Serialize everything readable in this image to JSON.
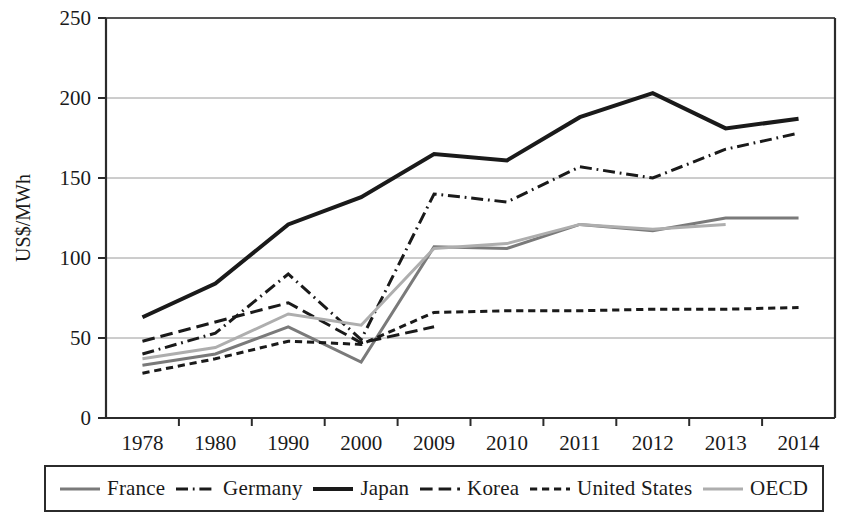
{
  "chart_data": {
    "type": "line",
    "title": "",
    "xlabel": "",
    "ylabel": "US$/MWh",
    "categories": [
      "1978",
      "1980",
      "1990",
      "2000",
      "2009",
      "2010",
      "2011",
      "2012",
      "2013",
      "2014"
    ],
    "ylim": [
      0,
      250
    ],
    "yticks": [
      0,
      50,
      100,
      150,
      200,
      250
    ],
    "grid": "horizontal",
    "legend_position": "bottom",
    "series": [
      {
        "name": "France",
        "color": "#7a7a7a",
        "style": "solid",
        "width": 3,
        "values": [
          33,
          40,
          57,
          35,
          107,
          106,
          121,
          117,
          125,
          125
        ]
      },
      {
        "name": "Germany",
        "color": "#1a1a1a",
        "style": "dashdot",
        "width": 3,
        "values": [
          40,
          53,
          90,
          49,
          140,
          135,
          157,
          150,
          168,
          178
        ]
      },
      {
        "name": "Japan",
        "color": "#1a1a1a",
        "style": "solid",
        "width": 4,
        "values": [
          63,
          84,
          121,
          138,
          165,
          161,
          188,
          203,
          181,
          187
        ]
      },
      {
        "name": "Korea",
        "color": "#1a1a1a",
        "style": "longdash",
        "width": 3,
        "values": [
          48,
          60,
          72,
          47,
          57,
          null,
          null,
          null,
          null,
          null
        ]
      },
      {
        "name": "United States",
        "color": "#1a1a1a",
        "style": "shortdash",
        "width": 3,
        "values": [
          28,
          37,
          48,
          46,
          66,
          67,
          67,
          68,
          68,
          69
        ]
      },
      {
        "name": "OECD",
        "color": "#aeaeae",
        "style": "solid",
        "width": 3,
        "values": [
          37,
          44,
          65,
          58,
          106,
          109,
          121,
          118,
          121,
          null
        ]
      }
    ]
  },
  "axis": {
    "y_title": "US$/MWh",
    "y_tick_labels": [
      "250",
      "200",
      "150",
      "100",
      "50",
      "0"
    ],
    "x_tick_labels": [
      "1978",
      "1980",
      "1990",
      "2000",
      "2009",
      "2010",
      "2011",
      "2012",
      "2013",
      "2014"
    ]
  },
  "legend": {
    "items": [
      {
        "label": "France",
        "style": "solid",
        "color": "#7a7a7a"
      },
      {
        "label": "Germany",
        "style": "dashdot",
        "color": "#1a1a1a"
      },
      {
        "label": "Japan",
        "style": "solid",
        "color": "#1a1a1a"
      },
      {
        "label": "Korea",
        "style": "longdash",
        "color": "#1a1a1a"
      },
      {
        "label": "United States",
        "style": "shortdash",
        "color": "#1a1a1a"
      },
      {
        "label": "OECD",
        "style": "solid",
        "color": "#aeaeae"
      }
    ]
  }
}
